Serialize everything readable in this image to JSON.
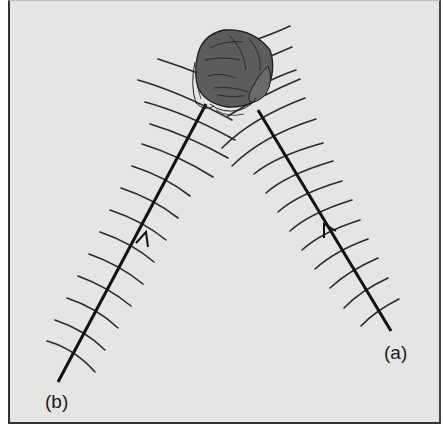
{
  "figure": {
    "labels": {
      "a": "(a)",
      "b": "(b)"
    },
    "colors": {
      "background": "#e5e5e4",
      "ray": "#111111",
      "wavefront": "#2a2a2a",
      "head": "#5c5c5c",
      "head_stroke": "#1e1e1e"
    },
    "rays": [
      {
        "name": "ray-a",
        "label": "(a)",
        "start": [
          391,
          331
        ],
        "end": [
          258,
          110
        ],
        "arrow_at": [
          327,
          229
        ]
      },
      {
        "name": "ray-b",
        "label": "(b)",
        "start": [
          58,
          382
        ],
        "end": [
          206,
          104
        ],
        "arrow_at": [
          146,
          235
        ]
      }
    ],
    "head": {
      "center": [
        230,
        60
      ],
      "description": "top view of head with ears"
    }
  }
}
